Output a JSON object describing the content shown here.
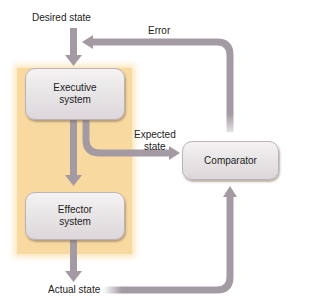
{
  "diagram": {
    "labels": {
      "desired_state": "Desired state",
      "error": "Error",
      "expected_state_line1": "Expected",
      "expected_state_line2": "state",
      "actual_state": "Actual state"
    },
    "boxes": {
      "executive_line1": "Executive",
      "executive_line2": "system",
      "effector_line1": "Effector",
      "effector_line2": "system",
      "comparator": "Comparator"
    },
    "colors": {
      "arrow": "#a39aa3",
      "panel": "#f8d9a0",
      "box": "#e8e4e6"
    }
  }
}
